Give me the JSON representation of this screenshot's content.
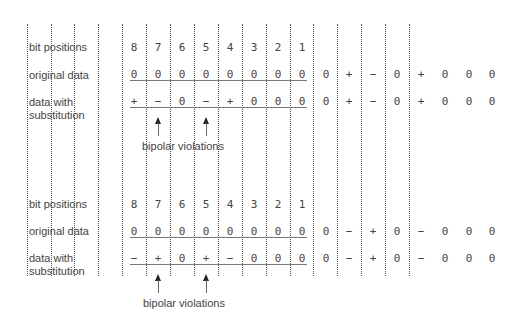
{
  "colors": {
    "text": "#444444",
    "dotted_line": "#555555",
    "underline": "#777777"
  },
  "grid": {
    "dotted_line_x": [
      27,
      51,
      74,
      98,
      122,
      146,
      170,
      194,
      218,
      242,
      266,
      290,
      313,
      337,
      361,
      385,
      409
    ]
  },
  "sections": [
    {
      "row_labels": {
        "bit_positions": "bit positions",
        "original_data": "original data",
        "data_with": "data with",
        "substitution": "substitution"
      },
      "bit_positions": [
        "8",
        "7",
        "6",
        "5",
        "4",
        "3",
        "2",
        "1"
      ],
      "original_data": [
        "0",
        "0",
        "0",
        "0",
        "0",
        "0",
        "0",
        "0"
      ],
      "substituted_data": [
        "+",
        "−",
        "0",
        "−",
        "+",
        "0",
        "0",
        "0"
      ],
      "following_original": [
        "0",
        "+",
        "−",
        "0",
        "+",
        "0",
        "0",
        "0"
      ],
      "following_substituted": [
        "0",
        "+",
        "−",
        "0",
        "+",
        "0",
        "0",
        "0"
      ],
      "violation_positions": [
        7,
        5
      ],
      "caption": "bipolar violations"
    },
    {
      "row_labels": {
        "bit_positions": "bit positions",
        "original_data": "original data",
        "data_with": "data with",
        "substitution": "substitution"
      },
      "bit_positions": [
        "8",
        "7",
        "6",
        "5",
        "4",
        "3",
        "2",
        "1"
      ],
      "original_data": [
        "0",
        "0",
        "0",
        "0",
        "0",
        "0",
        "0",
        "0"
      ],
      "substituted_data": [
        "−",
        "+",
        "0",
        "+",
        "−",
        "0",
        "0",
        "0"
      ],
      "following_original": [
        "0",
        "−",
        "+",
        "0",
        "−",
        "0",
        "0",
        "0"
      ],
      "following_substituted": [
        "0",
        "−",
        "+",
        "0",
        "−",
        "0",
        "0",
        "0"
      ],
      "violation_positions": [
        7,
        5
      ],
      "caption": "bipolar violations"
    }
  ]
}
